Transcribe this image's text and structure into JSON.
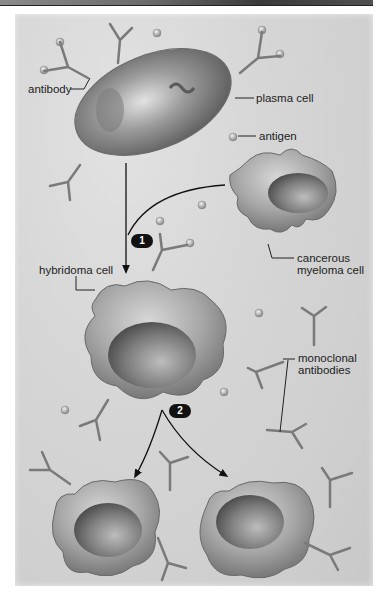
{
  "figure": {
    "title_strip": ""
  },
  "labels": {
    "antibody": "antibody",
    "plasma_cell": "plasma cell",
    "antigen": "antigen",
    "myeloma_line1": "cancerous",
    "myeloma_line2": "myeloma cell",
    "hybridoma": "hybridoma cell",
    "monoclonal_line1": "monoclonal",
    "monoclonal_line2": "antibodies"
  },
  "steps": [
    {
      "number": "1",
      "description": "fusion of plasma cell and myeloma cell"
    },
    {
      "number": "2",
      "description": "hybridoma cell divides"
    }
  ],
  "colors": {
    "background": "#d4d4d4",
    "cell_fill": "#a9a9a9",
    "cell_dark": "#6e6e6e",
    "antibody": "#777777",
    "leader_line": "#222222",
    "badge": "#111111"
  }
}
